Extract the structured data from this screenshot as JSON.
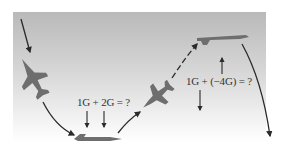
{
  "figure": {
    "labels": {
      "pullout": "1G + 2G = ?",
      "pushover": "1G + (−4G) = ?"
    },
    "colors": {
      "jet": "#6e6e6e",
      "arrow": "#2a2a2a",
      "panel_top": "#b9b9b9",
      "panel_bottom": "#ffffff"
    },
    "elements": [
      {
        "name": "jet-diving",
        "position": "upper-left"
      },
      {
        "name": "jet-level-bottom",
        "position": "bottom-center-left"
      },
      {
        "name": "jet-climbing",
        "position": "center"
      },
      {
        "name": "jet-level-top",
        "position": "upper-right"
      }
    ]
  }
}
